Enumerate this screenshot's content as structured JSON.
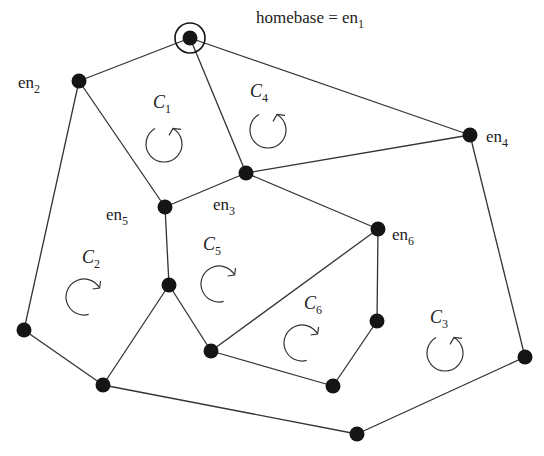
{
  "diagram": {
    "title_label": {
      "text": "homebase = en",
      "sub": "1",
      "x": 256,
      "y": 23
    },
    "nodes": [
      {
        "id": "en1",
        "x": 190,
        "y": 38,
        "homebase": true
      },
      {
        "id": "en2",
        "x": 79,
        "y": 81
      },
      {
        "id": "en3",
        "x": 246,
        "y": 173
      },
      {
        "id": "en4",
        "x": 470,
        "y": 135
      },
      {
        "id": "en5",
        "x": 165,
        "y": 207
      },
      {
        "id": "en6",
        "x": 378,
        "y": 229
      },
      {
        "id": "n7",
        "x": 169,
        "y": 285
      },
      {
        "id": "n8",
        "x": 24,
        "y": 330
      },
      {
        "id": "n9",
        "x": 103,
        "y": 385
      },
      {
        "id": "n10",
        "x": 211,
        "y": 351
      },
      {
        "id": "n11",
        "x": 377,
        "y": 321
      },
      {
        "id": "n12",
        "x": 333,
        "y": 386
      },
      {
        "id": "n13",
        "x": 525,
        "y": 357
      },
      {
        "id": "n14",
        "x": 357,
        "y": 434
      }
    ],
    "edges": [
      [
        "en1",
        "en2"
      ],
      [
        "en1",
        "en3"
      ],
      [
        "en1",
        "en4"
      ],
      [
        "en2",
        "en5"
      ],
      [
        "en2",
        "n8"
      ],
      [
        "en3",
        "en4"
      ],
      [
        "en3",
        "en5"
      ],
      [
        "en3",
        "en6"
      ],
      [
        "en4",
        "n13"
      ],
      [
        "en5",
        "n7"
      ],
      [
        "en6",
        "n10"
      ],
      [
        "en6",
        "n11"
      ],
      [
        "n7",
        "n9"
      ],
      [
        "n7",
        "n10"
      ],
      [
        "n8",
        "n9"
      ],
      [
        "n9",
        "n14"
      ],
      [
        "n10",
        "n12"
      ],
      [
        "n11",
        "n12"
      ],
      [
        "n13",
        "n14"
      ]
    ],
    "node_labels": [
      {
        "text": "en",
        "sub": "2",
        "x": 18,
        "y": 88
      },
      {
        "text": "en",
        "sub": "3",
        "x": 213,
        "y": 210
      },
      {
        "text": "en",
        "sub": "4",
        "x": 486,
        "y": 142
      },
      {
        "text": "en",
        "sub": "5",
        "x": 106,
        "y": 220
      },
      {
        "text": "en",
        "sub": "6",
        "x": 392,
        "y": 240
      }
    ],
    "cycles": [
      {
        "name": "C",
        "sub": "1",
        "x": 153,
        "y": 108,
        "cx": 164,
        "cy": 144,
        "dir": "ccw"
      },
      {
        "name": "C",
        "sub": "2",
        "x": 82,
        "y": 263,
        "cx": 84,
        "cy": 297,
        "dir": "cw"
      },
      {
        "name": "C",
        "sub": "3",
        "x": 430,
        "y": 323,
        "cx": 445,
        "cy": 353,
        "dir": "ccw"
      },
      {
        "name": "C",
        "sub": "4",
        "x": 250,
        "y": 97,
        "cx": 268,
        "cy": 130,
        "dir": "ccw"
      },
      {
        "name": "C",
        "sub": "5",
        "x": 203,
        "y": 250,
        "cx": 219,
        "cy": 284,
        "dir": "cw"
      },
      {
        "name": "C",
        "sub": "6",
        "x": 304,
        "y": 309,
        "cx": 302,
        "cy": 343,
        "dir": "cw"
      }
    ]
  }
}
